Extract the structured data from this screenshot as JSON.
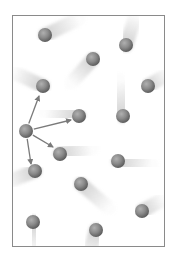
{
  "diagram": {
    "frame": {
      "x": 12,
      "y": 15,
      "width": 153,
      "height": 232,
      "border_color": "#8a8a8a"
    },
    "colors": {
      "sphere_light": "#b0b0b0",
      "sphere_mid": "#8a8a8a",
      "sphere_dark": "#5e5e5e",
      "trail": "#cfcfcf",
      "arrow": "#7a7a7a"
    },
    "sphere_radius": 7,
    "particles": [
      {
        "x": 45,
        "y": 35,
        "trail_dx": 34,
        "trail_dy": -16
      },
      {
        "x": 126,
        "y": 45,
        "trail_dx": 10,
        "trail_dy": -30
      },
      {
        "x": 93,
        "y": 59,
        "trail_dx": -22,
        "trail_dy": 24
      },
      {
        "x": 43,
        "y": 86,
        "trail_dx": -30,
        "trail_dy": -14
      },
      {
        "x": 148,
        "y": 86,
        "trail_dx": 20,
        "trail_dy": -12
      },
      {
        "x": 79,
        "y": 116,
        "trail_dx": -34,
        "trail_dy": -4
      },
      {
        "x": 123,
        "y": 116,
        "trail_dx": -4,
        "trail_dy": -36
      },
      {
        "x": 60,
        "y": 154,
        "trail_dx": 32,
        "trail_dy": -6
      },
      {
        "x": 118,
        "y": 161,
        "trail_dx": 34,
        "trail_dy": 4
      },
      {
        "x": 35,
        "y": 171,
        "trail_dx": -30,
        "trail_dy": 12
      },
      {
        "x": 81,
        "y": 184,
        "trail_dx": 28,
        "trail_dy": 24
      },
      {
        "x": 142,
        "y": 211,
        "trail_dx": 22,
        "trail_dy": -12
      },
      {
        "x": 33,
        "y": 222,
        "trail_dx": 2,
        "trail_dy": 30
      },
      {
        "x": 96,
        "y": 230,
        "trail_dx": -8,
        "trail_dy": 28
      }
    ],
    "center_particle": {
      "x": 26,
      "y": 131
    },
    "arrows": [
      {
        "name": "arrow-up",
        "x2": 39,
        "y2": 96
      },
      {
        "name": "arrow-right",
        "x2": 71,
        "y2": 120
      },
      {
        "name": "arrow-down-right",
        "x2": 53,
        "y2": 147
      },
      {
        "name": "arrow-down",
        "x2": 31,
        "y2": 164
      }
    ]
  }
}
